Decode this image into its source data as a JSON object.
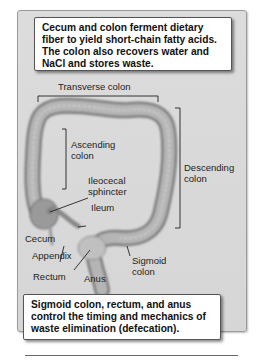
{
  "callouts": {
    "top": [
      "Cecum and colon ferment dietary",
      "fiber to yield short-chain fatty acids.",
      "The colon also recovers water and",
      "NaCl and stores waste."
    ],
    "bottom": [
      "Sigmoid colon, rectum, and anus",
      "control the timing and mechanics of",
      "waste elimination (defecation)."
    ]
  },
  "labels": {
    "transverse_colon": "Transverse colon",
    "ascending_colon": [
      "Ascending",
      "colon"
    ],
    "descending_colon": [
      "Descending",
      "colon"
    ],
    "ileocecal_sphincter": [
      "Ileocecal",
      "sphincter"
    ],
    "ileum": "Ileum",
    "cecum": "Cecum",
    "appendix": "Appendix",
    "sigmoid_colon": [
      "Sigmoid",
      "colon"
    ],
    "rectum": "Rectum",
    "anus": "Anus"
  },
  "colors": {
    "frame_bg": "#d8d8d8",
    "colon_fill": "#a8a8a8",
    "colon_edge": "#7a7a7a",
    "callout_bg": "#ffffff"
  }
}
